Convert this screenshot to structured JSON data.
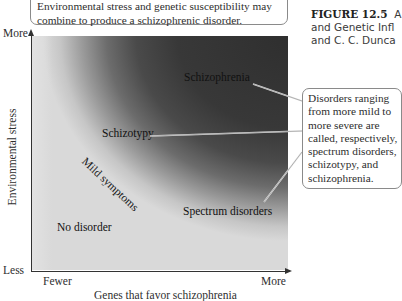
{
  "caption": {
    "text": "Environmental stress and genetic susceptibility may combine to produce a schizophrenic disorder."
  },
  "figure_title": {
    "number": "FIGURE 12.5",
    "line1_rest": "A",
    "line2": "and Genetic Infl",
    "line3": "and C. C. Dunca"
  },
  "axes": {
    "y_title": "Environmental stress",
    "y_top": "More",
    "y_bottom": "Less",
    "x_title": "Genes that favor schizophrenia",
    "x_left": "Fewer",
    "x_right": "More"
  },
  "regions": {
    "schizophrenia": "Schizophrenia",
    "schizotypy": "Schizotypy",
    "mild_symptoms": "Mild symptoms",
    "spectrum_disorders": "Spectrum disorders",
    "no_disorder": "No disorder"
  },
  "callout": {
    "lines": [
      "Disorders ranging",
      "from more mild to",
      "more severe are",
      "called, respectively,",
      "spectrum disorders,",
      "schizotypy, and",
      "schizophrenia."
    ]
  },
  "colors": {
    "dark_core": "#2f2f2f",
    "light_field": "#d9d9d9",
    "axis": "#333333",
    "box_border": "#8a8a8a"
  }
}
